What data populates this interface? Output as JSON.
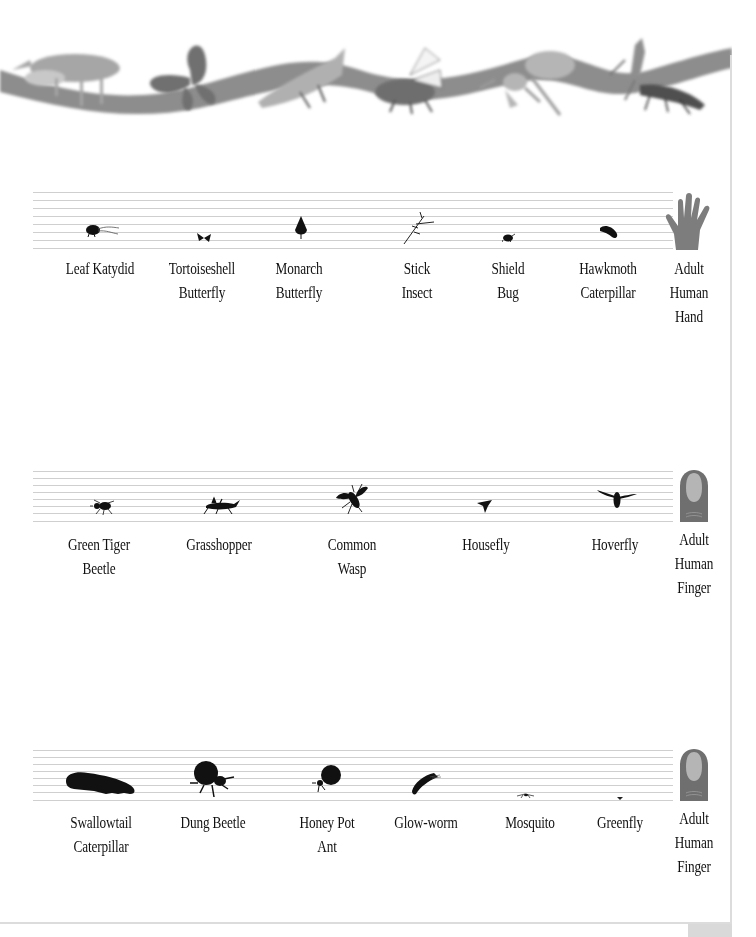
{
  "banner": {
    "description": "Decorative ribbon with grey insect illustrations",
    "insects": [
      "stag beetle",
      "butterfly",
      "grasshopper",
      "fly",
      "ant",
      "praying mantis",
      "earwig"
    ],
    "ribbon_color": "#8a8a8a"
  },
  "colors": {
    "silhouette": "#111111",
    "reference": "#7d7d7d",
    "nail": "#b5b5b5",
    "staff_line": "#cfcfcf",
    "border": "#dcdcdc"
  },
  "rows": [
    {
      "reference": {
        "icon": "hand-icon",
        "label_lines": [
          "Adult",
          "Human",
          "Hand"
        ]
      },
      "items": [
        {
          "name": "Leaf Katydid",
          "label_lines": [
            "Leaf Katydid"
          ],
          "icon": "katydid-icon"
        },
        {
          "name": "Tortoiseshell Butterfly",
          "label_lines": [
            "Tortoiseshell",
            "Butterfly"
          ],
          "icon": "butterfly-icon"
        },
        {
          "name": "Monarch Butterfly",
          "label_lines": [
            "Monarch",
            "Butterfly"
          ],
          "icon": "monarch-icon"
        },
        {
          "name": "Stick Insect",
          "label_lines": [
            "Stick",
            "Insect"
          ],
          "icon": "stick-insect-icon"
        },
        {
          "name": "Shield Bug",
          "label_lines": [
            "Shield",
            "Bug"
          ],
          "icon": "shield-bug-icon"
        },
        {
          "name": "Hawkmoth Caterpillar",
          "label_lines": [
            "Hawkmoth",
            "Caterpillar"
          ],
          "icon": "caterpillar-icon"
        }
      ]
    },
    {
      "reference": {
        "icon": "finger-icon",
        "label_lines": [
          "Adult",
          "Human",
          "Finger"
        ]
      },
      "items": [
        {
          "name": "Green Tiger Beetle",
          "label_lines": [
            "Green Tiger",
            "Beetle"
          ],
          "icon": "beetle-icon"
        },
        {
          "name": "Grasshopper",
          "label_lines": [
            "Grasshopper"
          ],
          "icon": "grasshopper-icon"
        },
        {
          "name": "Common Wasp",
          "label_lines": [
            "Common",
            "Wasp"
          ],
          "icon": "wasp-icon"
        },
        {
          "name": "Housefly",
          "label_lines": [
            "Housefly"
          ],
          "icon": "housefly-icon"
        },
        {
          "name": "Hoverfly",
          "label_lines": [
            "Hoverfly"
          ],
          "icon": "hoverfly-icon"
        }
      ]
    },
    {
      "reference": {
        "icon": "finger-icon",
        "label_lines": [
          "Adult",
          "Human",
          "Finger"
        ]
      },
      "items": [
        {
          "name": "Swallowtail Caterpillar",
          "label_lines": [
            "Swallowtail",
            "Caterpillar"
          ],
          "icon": "caterpillar-icon"
        },
        {
          "name": "Dung Beetle",
          "label_lines": [
            "Dung Beetle"
          ],
          "icon": "dung-beetle-icon"
        },
        {
          "name": "Honey Pot Ant",
          "label_lines": [
            "Honey Pot",
            "Ant"
          ],
          "icon": "honey-pot-ant-icon"
        },
        {
          "name": "Glow-worm",
          "label_lines": [
            "Glow-worm"
          ],
          "icon": "glow-worm-icon"
        },
        {
          "name": "Mosquito",
          "label_lines": [
            "Mosquito"
          ],
          "icon": "mosquito-icon"
        },
        {
          "name": "Greenfly",
          "label_lines": [
            "Greenfly"
          ],
          "icon": "greenfly-icon"
        }
      ]
    }
  ]
}
